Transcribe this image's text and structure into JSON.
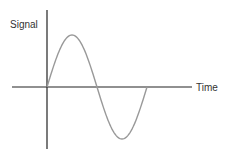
{
  "chart_data": {
    "type": "line",
    "title": "",
    "xlabel": "Time",
    "ylabel": "Signal",
    "grid": false,
    "legend": "none",
    "series": [
      {
        "name": "signal",
        "function": "sine",
        "cycles": 1,
        "amplitude": 1,
        "phase": 0
      }
    ],
    "xlim": [
      0,
      1.4
    ],
    "ylim": [
      -1.25,
      1.25
    ]
  },
  "colors": {
    "axis": "#222222",
    "curve": "#999999",
    "text": "#333333"
  }
}
